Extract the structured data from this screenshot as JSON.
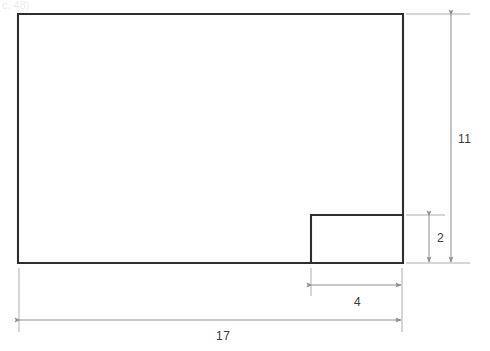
{
  "figure": {
    "canvas": {
      "width": 490,
      "height": 351
    },
    "colors": {
      "background": "#ffffff",
      "shape_stroke": "#2e2e2e",
      "dimension_line": "#8e8e8e",
      "extension_line": "#adadad",
      "label_text": "#3a3a3a"
    },
    "top_artifact": {
      "text": "c. 48)"
    }
  },
  "shape": {
    "name": "l-shaped-rectilinear-polygon",
    "outer_rect": {
      "x": 18,
      "y": 14,
      "width": 385,
      "height": 249
    },
    "notch_rect": {
      "x": 311,
      "y": 215,
      "width": 92,
      "height": 48
    }
  },
  "dimensions": [
    {
      "id": "height-overall",
      "label": "11",
      "orientation": "vertical",
      "measures": "overall height of figure",
      "label_x": 458,
      "label_y": 133
    },
    {
      "id": "height-notch",
      "label": "2",
      "orientation": "vertical",
      "measures": "height of lower-right notch",
      "label_x": 437,
      "label_y": 232
    },
    {
      "id": "width-notch",
      "label": "4",
      "orientation": "horizontal",
      "measures": "width of lower-right notch",
      "label_x": 354,
      "label_y": 296
    },
    {
      "id": "width-overall",
      "label": "17",
      "orientation": "horizontal",
      "measures": "overall width of figure",
      "label_x": 216,
      "label_y": 330
    }
  ]
}
